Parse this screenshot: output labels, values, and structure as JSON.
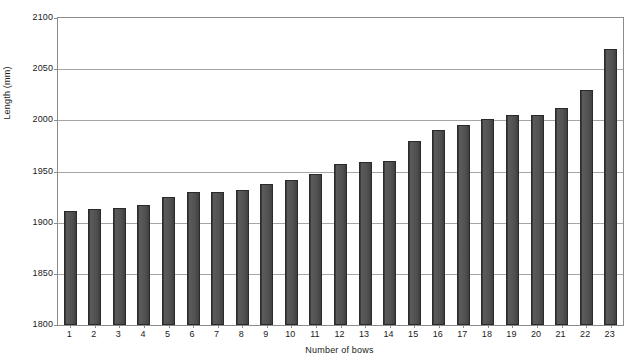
{
  "chart_data": {
    "type": "bar",
    "title": "",
    "xlabel": "Number of bows",
    "ylabel": "Length (mm)",
    "categories": [
      "1",
      "2",
      "3",
      "4",
      "5",
      "6",
      "7",
      "8",
      "9",
      "10",
      "11",
      "12",
      "13",
      "14",
      "15",
      "16",
      "17",
      "18",
      "19",
      "20",
      "21",
      "22",
      "23"
    ],
    "values": [
      1911,
      1913,
      1914,
      1917,
      1925,
      1930,
      1930,
      1932,
      1938,
      1942,
      1948,
      1957,
      1959,
      1960,
      1980,
      1991,
      1995,
      2001,
      2005,
      2005,
      2012,
      2030,
      2070
    ],
    "ylim": [
      1800,
      2100
    ],
    "yticks": [
      1800,
      1850,
      1900,
      1950,
      2000,
      2050,
      2100
    ],
    "ytick_labels": [
      "1800",
      "1850",
      "1900",
      "1950",
      "2000",
      "2050",
      "2100"
    ],
    "grid": true,
    "legend": false,
    "bar_color": "#4f4f4f",
    "bar_edge_color": "#2b2b2b",
    "gridline_color": "#a6a6a6",
    "axis_color": "#8c8c8c",
    "plot_background": "#ffffff"
  }
}
